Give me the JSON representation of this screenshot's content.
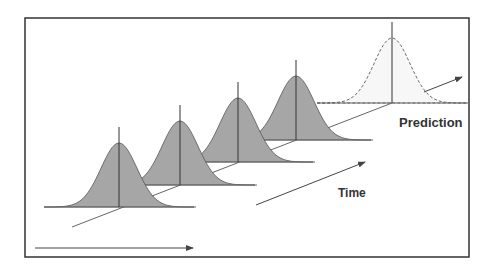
{
  "diagram": {
    "labels": {
      "prediction": "Prediction",
      "time": "Time"
    },
    "colors": {
      "frame": "#333333",
      "curve_fill": "#a6a6a6",
      "curve_stroke": "#555555",
      "axis_line": "#666666",
      "prediction_fill": "#f7f7f7",
      "prediction_stroke": "#444444",
      "text": "#333333"
    },
    "distributions": [
      {
        "id": "t1",
        "type": "observed",
        "center_x": 119,
        "base_y": 207,
        "peak_height": 64
      },
      {
        "id": "t2",
        "type": "observed",
        "center_x": 180,
        "base_y": 185,
        "peak_height": 64
      },
      {
        "id": "t3",
        "type": "observed",
        "center_x": 238,
        "base_y": 162,
        "peak_height": 64
      },
      {
        "id": "t4",
        "type": "observed",
        "center_x": 296,
        "base_y": 140,
        "peak_height": 64
      },
      {
        "id": "t5",
        "type": "prediction",
        "center_x": 392,
        "base_y": 103,
        "peak_height": 65
      }
    ]
  }
}
